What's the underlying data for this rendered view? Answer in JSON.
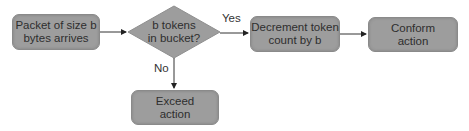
{
  "diagram": {
    "type": "flowchart",
    "nodes": {
      "start": {
        "label": "Packet of size b bytes arrives",
        "line1": "Packet of size b",
        "line2": "bytes arrives",
        "shape": "rounded-rect"
      },
      "decision": {
        "label": "b tokens in bucket?",
        "line1": "b tokens",
        "line2": "in bucket?",
        "shape": "diamond"
      },
      "decrement": {
        "label": "Decrement token count by b",
        "line1": "Decrement token",
        "line2": "count by b",
        "shape": "rounded-rect"
      },
      "conform": {
        "label": "Conform action",
        "line1": "Conform",
        "line2": "action",
        "shape": "rounded-rect"
      },
      "exceed": {
        "label": "Exceed action",
        "line1": "Exceed",
        "line2": "action",
        "shape": "rounded-rect"
      }
    },
    "edges": [
      {
        "from": "start",
        "to": "decision",
        "label": ""
      },
      {
        "from": "decision",
        "to": "decrement",
        "label": "Yes"
      },
      {
        "from": "decrement",
        "to": "conform",
        "label": ""
      },
      {
        "from": "decision",
        "to": "exceed",
        "label": "No"
      }
    ],
    "edge_labels": {
      "yes": "Yes",
      "no": "No"
    },
    "colors": {
      "node_fill": "#9d9d9d",
      "text": "#2e2e2e",
      "line": "#333333"
    }
  }
}
